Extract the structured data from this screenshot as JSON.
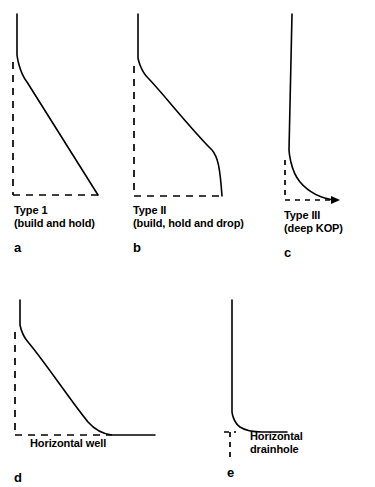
{
  "figure": {
    "background_color": "#ffffff",
    "stroke_color": "#000000",
    "width": 375,
    "height": 487
  },
  "panels": [
    {
      "id": "a",
      "letter": "a",
      "caption_line1": "Type 1",
      "caption_line2": "(build and hold)",
      "description": "Build and hold well trajectory: vertical section, kick-off point, build curve, then straight tangent section to target",
      "well_path": "M17,14 L17,55 C17,55 19,72 27,82 L98,195",
      "ref_vertical": "M13,62 L13,195",
      "ref_horizontal": "M13,195 L98,195",
      "caption_x": 14,
      "caption_y": 204,
      "letter_x": 14,
      "letter_y": 240
    },
    {
      "id": "b",
      "letter": "b",
      "caption_line1": "Type II",
      "caption_line2": "(build, hold and drop)",
      "description": "Build, hold and drop trajectory: vertical, build curve, tangent, then drop-off section back toward vertical",
      "well_path": "M138,14 L138,58 C138,58 140,70 148,78 C160,90 190,128 212,150 C218,157 220,168 222,196",
      "ref_vertical": "M134,66 L134,196",
      "ref_horizontal": "M134,196 L222,196",
      "caption_x": 133,
      "caption_y": 204,
      "letter_x": 133,
      "letter_y": 240
    },
    {
      "id": "c",
      "letter": "c",
      "caption_line1": "Type III",
      "caption_line2": "(deep KOP)",
      "description": "Deep kick-off point trajectory: long vertical section then a sharp build curve to horizontal target",
      "well_path": "M292,14 L289,150 C289,150 290,170 300,182 C312,196 326,199 335,200",
      "ref_vertical": "M285,160 L285,200",
      "ref_horizontal": "M285,200 L337,200",
      "arrow_head": "M331,196 L340,200 L331,204 Z",
      "caption_x": 284,
      "caption_y": 209,
      "letter_x": 284,
      "letter_y": 245
    },
    {
      "id": "d",
      "letter": "d",
      "caption_line1": "",
      "caption_line2": "",
      "inline_label": "Horizontal well",
      "description": "Horizontal well: vertical section, kick-off, long build curve flattening to a long horizontal drainhole section",
      "well_path": "M20,300 L20,325 C20,325 22,335 28,342 C45,362 70,400 88,422 C95,430 103,434 112,435 L155,435",
      "ref_vertical": "M15,332 L15,435",
      "ref_horizontal": "M15,435 L112,435",
      "label_x": 30,
      "label_y": 443,
      "letter_x": 14,
      "letter_y": 477
    },
    {
      "id": "e",
      "letter": "e",
      "caption_line1": "",
      "caption_line2": "",
      "inline_label_line1": "Horizontal",
      "inline_label_line2": "drainhole",
      "description": "Horizontal drainhole: very long vertical section with a short-radius curve into a short horizontal drainhole",
      "well_path": "M232,300 L232,412 C232,412 233,422 240,427 C246,431 254,432 262,432 L287,432",
      "ref_vertical": "M230,432 L230,458",
      "ref_horizontal": "M224,432 L236,432",
      "label_x": 250,
      "label_y": 437,
      "letter_x": 227,
      "letter_y": 472
    }
  ]
}
